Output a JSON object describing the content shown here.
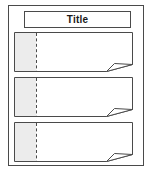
{
  "document": {
    "title_label": "Title",
    "frame_name": "outer-border",
    "background_color": "#ffffff",
    "border_color": "#4a4a4a"
  },
  "title_bar": {
    "label": "Title",
    "border_color": "#4a4a4a",
    "fill_color": "#ffffff",
    "text_color": "#1a1a1a"
  },
  "panels": [
    {
      "index": "1",
      "gutter_fill": "#ececec",
      "body_fill": "#ffffff",
      "divider_style": "dashed",
      "corner_icon": "folded-corner-icon"
    },
    {
      "index": "2",
      "gutter_fill": "#ececec",
      "body_fill": "#ffffff",
      "divider_style": "dashed",
      "corner_icon": "folded-corner-icon"
    },
    {
      "index": "3",
      "gutter_fill": "#ececec",
      "body_fill": "#ffffff",
      "divider_style": "dashed",
      "corner_icon": "folded-corner-icon"
    }
  ]
}
